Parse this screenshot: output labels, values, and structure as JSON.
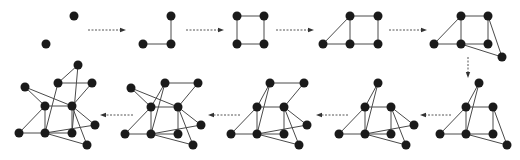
{
  "diagram": {
    "title": "",
    "colors": {
      "node": "#1a1a1a",
      "edge": "#4a4a4a",
      "arrow": "#555555",
      "background": "#ffffff"
    },
    "node_radius": 4.5,
    "graphs": [
      {
        "id": "g1",
        "nodes": [
          [
            74,
            16
          ],
          [
            46,
            44
          ]
        ],
        "edges": []
      },
      {
        "id": "g2",
        "nodes": [
          [
            171,
            16
          ],
          [
            143,
            44
          ],
          [
            171,
            44
          ]
        ],
        "edges": [
          [
            0,
            2
          ],
          [
            1,
            2
          ]
        ]
      },
      {
        "id": "g3",
        "nodes": [
          [
            237,
            16
          ],
          [
            264,
            16
          ],
          [
            237,
            44
          ],
          [
            264,
            44
          ]
        ],
        "edges": [
          [
            0,
            1
          ],
          [
            0,
            2
          ],
          [
            1,
            3
          ],
          [
            2,
            3
          ]
        ]
      },
      {
        "id": "g4",
        "nodes": [
          [
            350,
            16
          ],
          [
            378,
            16
          ],
          [
            323,
            44
          ],
          [
            350,
            44
          ],
          [
            378,
            44
          ]
        ],
        "edges": [
          [
            0,
            1
          ],
          [
            0,
            2
          ],
          [
            0,
            3
          ],
          [
            1,
            4
          ],
          [
            2,
            3
          ],
          [
            3,
            4
          ]
        ]
      },
      {
        "id": "g5",
        "nodes": [
          [
            461,
            16
          ],
          [
            488,
            16
          ],
          [
            434,
            44
          ],
          [
            461,
            44
          ],
          [
            488,
            44
          ],
          [
            502,
            57
          ]
        ],
        "edges": [
          [
            0,
            1
          ],
          [
            0,
            2
          ],
          [
            0,
            3
          ],
          [
            1,
            4
          ],
          [
            2,
            3
          ],
          [
            3,
            4
          ],
          [
            1,
            5
          ],
          [
            3,
            5
          ]
        ]
      },
      {
        "id": "g6",
        "nodes": [
          [
            479,
            83
          ],
          [
            466,
            107
          ],
          [
            493,
            107
          ],
          [
            440,
            134
          ],
          [
            466,
            134
          ],
          [
            493,
            134
          ],
          [
            507,
            145
          ]
        ],
        "edges": [
          [
            0,
            1
          ],
          [
            0,
            4
          ],
          [
            1,
            2
          ],
          [
            1,
            3
          ],
          [
            1,
            4
          ],
          [
            2,
            5
          ],
          [
            2,
            6
          ],
          [
            3,
            4
          ],
          [
            4,
            5
          ],
          [
            4,
            6
          ]
        ]
      },
      {
        "id": "g7",
        "nodes": [
          [
            378,
            83
          ],
          [
            365,
            107
          ],
          [
            391,
            107
          ],
          [
            339,
            134
          ],
          [
            365,
            134
          ],
          [
            391,
            134
          ],
          [
            414,
            125
          ],
          [
            406,
            145
          ]
        ],
        "edges": [
          [
            0,
            1
          ],
          [
            0,
            4
          ],
          [
            1,
            2
          ],
          [
            1,
            3
          ],
          [
            1,
            4
          ],
          [
            2,
            5
          ],
          [
            2,
            6
          ],
          [
            2,
            7
          ],
          [
            3,
            4
          ],
          [
            4,
            5
          ],
          [
            4,
            6
          ],
          [
            4,
            7
          ]
        ]
      },
      {
        "id": "g8",
        "nodes": [
          [
            270,
            83
          ],
          [
            304,
            83
          ],
          [
            257,
            107
          ],
          [
            284,
            107
          ],
          [
            231,
            134
          ],
          [
            257,
            134
          ],
          [
            284,
            134
          ],
          [
            307,
            125
          ],
          [
            299,
            145
          ]
        ],
        "edges": [
          [
            0,
            1
          ],
          [
            0,
            2
          ],
          [
            0,
            5
          ],
          [
            1,
            3
          ],
          [
            2,
            3
          ],
          [
            2,
            4
          ],
          [
            2,
            5
          ],
          [
            3,
            6
          ],
          [
            3,
            7
          ],
          [
            3,
            8
          ],
          [
            4,
            5
          ],
          [
            5,
            6
          ],
          [
            5,
            7
          ],
          [
            5,
            8
          ]
        ]
      },
      {
        "id": "g9",
        "nodes": [
          [
            131,
            88
          ],
          [
            165,
            83
          ],
          [
            198,
            83
          ],
          [
            151,
            107
          ],
          [
            178,
            107
          ],
          [
            125,
            134
          ],
          [
            151,
            134
          ],
          [
            178,
            134
          ],
          [
            201,
            125
          ],
          [
            193,
            145
          ]
        ],
        "edges": [
          [
            0,
            3
          ],
          [
            0,
            4
          ],
          [
            1,
            2
          ],
          [
            1,
            3
          ],
          [
            1,
            6
          ],
          [
            2,
            4
          ],
          [
            3,
            4
          ],
          [
            3,
            5
          ],
          [
            3,
            6
          ],
          [
            4,
            7
          ],
          [
            4,
            8
          ],
          [
            4,
            9
          ],
          [
            5,
            6
          ],
          [
            6,
            7
          ],
          [
            6,
            8
          ],
          [
            6,
            9
          ]
        ]
      },
      {
        "id": "g10",
        "nodes": [
          [
            78,
            65
          ],
          [
            25,
            87
          ],
          [
            58,
            83
          ],
          [
            92,
            83
          ],
          [
            45,
            106
          ],
          [
            72,
            106
          ],
          [
            19,
            133
          ],
          [
            45,
            133
          ],
          [
            72,
            133
          ],
          [
            95,
            125
          ],
          [
            87,
            145
          ]
        ],
        "edges": [
          [
            0,
            2
          ],
          [
            0,
            8
          ],
          [
            1,
            4
          ],
          [
            1,
            5
          ],
          [
            2,
            3
          ],
          [
            2,
            7
          ],
          [
            3,
            5
          ],
          [
            4,
            5
          ],
          [
            4,
            6
          ],
          [
            4,
            7
          ],
          [
            5,
            8
          ],
          [
            5,
            9
          ],
          [
            5,
            10
          ],
          [
            6,
            7
          ],
          [
            7,
            8
          ],
          [
            7,
            9
          ],
          [
            7,
            10
          ]
        ]
      }
    ],
    "arrows": [
      {
        "id": "a1",
        "from": [
          88,
          30
        ],
        "to": [
          126,
          30
        ],
        "direction": "right"
      },
      {
        "id": "a2",
        "from": [
          186,
          30
        ],
        "to": [
          224,
          30
        ],
        "direction": "right"
      },
      {
        "id": "a3",
        "from": [
          276,
          30
        ],
        "to": [
          314,
          30
        ],
        "direction": "right"
      },
      {
        "id": "a4",
        "from": [
          389,
          30
        ],
        "to": [
          427,
          30
        ],
        "direction": "right"
      },
      {
        "id": "a5",
        "from": [
          468,
          57
        ],
        "to": [
          468,
          78
        ],
        "direction": "down"
      },
      {
        "id": "a6",
        "from": [
          451,
          115
        ],
        "to": [
          420,
          115
        ],
        "direction": "left"
      },
      {
        "id": "a7",
        "from": [
          348,
          115
        ],
        "to": [
          316,
          115
        ],
        "direction": "left"
      },
      {
        "id": "a8",
        "from": [
          240,
          115
        ],
        "to": [
          208,
          115
        ],
        "direction": "left"
      },
      {
        "id": "a9",
        "from": [
          133,
          115
        ],
        "to": [
          100,
          115
        ],
        "direction": "left"
      }
    ]
  }
}
